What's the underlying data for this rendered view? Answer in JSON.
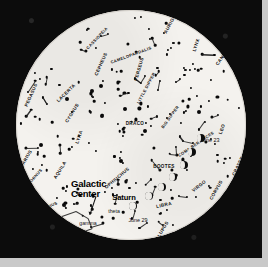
{
  "chart_data": {
    "type": "scatter",
    "subtitle": "Circular whole-sky map centered on the zenith",
    "xlabel": "",
    "ylabel": "",
    "grid": false,
    "legend_position": "none",
    "projection": "all-sky circular (polar)",
    "constellations": [
      {
        "name": "CASSIOPEIA",
        "x": 97,
        "y": 38,
        "rot": -46
      },
      {
        "name": "CAMELOPARDALIS",
        "x": 131,
        "y": 55,
        "rot": -20
      },
      {
        "name": "CEPHEUS",
        "x": 101,
        "y": 64,
        "rot": -66
      },
      {
        "name": "PERSEUS",
        "x": 139,
        "y": 69,
        "rot": -74
      },
      {
        "name": "AURIGA",
        "x": 170,
        "y": 24,
        "rot": -62
      },
      {
        "name": "LYNX",
        "x": 196,
        "y": 45,
        "rot": -72
      },
      {
        "name": "CANCER",
        "x": 223,
        "y": 56,
        "rot": -55
      },
      {
        "name": "PEGASUS",
        "x": 31,
        "y": 95,
        "rot": -66
      },
      {
        "name": "LACERTA",
        "x": 66,
        "y": 93,
        "rot": -44
      },
      {
        "name": "CYGNUS",
        "x": 72,
        "y": 113,
        "rot": -58
      },
      {
        "name": "LITTLE DIPPER",
        "x": 146,
        "y": 88,
        "rot": -62
      },
      {
        "name": "DRACO",
        "x": 135,
        "y": 123,
        "rot": 0
      },
      {
        "name": "BIG DIPPER",
        "x": 170,
        "y": 117,
        "rot": -54
      },
      {
        "name": "LYRA",
        "x": 79,
        "y": 137,
        "rot": -72
      },
      {
        "name": "COMA BERENICES",
        "x": 196,
        "y": 144,
        "rot": -34
      },
      {
        "name": "LEO",
        "x": 222,
        "y": 129,
        "rot": -70
      },
      {
        "name": "AQUILA",
        "x": 60,
        "y": 170,
        "rot": -58
      },
      {
        "name": "AQUARIUS",
        "x": 24,
        "y": 162,
        "rot": -60
      },
      {
        "name": "CAPRICORNUS",
        "x": 30,
        "y": 182,
        "rot": -48
      },
      {
        "name": "SAGITTARIUS",
        "x": 43,
        "y": 209,
        "rot": -24
      },
      {
        "name": "OPHIUCHUS",
        "x": 117,
        "y": 178,
        "rot": -40
      },
      {
        "name": "BOOTES",
        "x": 164,
        "y": 166,
        "rot": 0
      },
      {
        "name": "VIRGO",
        "x": 199,
        "y": 186,
        "rot": -38
      },
      {
        "name": "CORVUS",
        "x": 216,
        "y": 190,
        "rot": -60
      },
      {
        "name": "CRATER",
        "x": 238,
        "y": 166,
        "rot": -64
      },
      {
        "name": "LIBRA",
        "x": 164,
        "y": 205,
        "rot": -12
      },
      {
        "name": "LUPUS",
        "x": 163,
        "y": 229,
        "rot": -60
      },
      {
        "name": "SCORPIUS",
        "x": 123,
        "y": 248,
        "rot": -8
      },
      {
        "name": "HYDRA",
        "x": 213,
        "y": 223,
        "rot": -40
      }
    ],
    "annotations": [
      {
        "label": "Galactic Center",
        "x": 71,
        "y": 188,
        "style": "big"
      },
      {
        "label": "Saturn",
        "x": 124,
        "y": 197,
        "style": "mid"
      },
      {
        "label": "TEAPOT",
        "x": 63,
        "y": 229,
        "style": "mid"
      },
      {
        "label": "theta",
        "x": 114,
        "y": 211,
        "style": "small"
      },
      {
        "label": "gamma",
        "x": 88,
        "y": 223,
        "style": "small"
      },
      {
        "label": "June 23",
        "x": 210,
        "y": 140,
        "style": "date"
      },
      {
        "label": "June 29",
        "x": 138,
        "y": 220,
        "style": "date"
      }
    ],
    "moon_phases": [
      {
        "date": "June 23",
        "x": 201,
        "y": 138,
        "illum": 0.55
      },
      {
        "date": "",
        "x": 192,
        "y": 152,
        "illum": 0.45
      },
      {
        "date": "",
        "x": 184,
        "y": 165,
        "illum": 0.38
      },
      {
        "date": "",
        "x": 173,
        "y": 177,
        "illum": 0.3
      },
      {
        "date": "",
        "x": 162,
        "y": 187,
        "illum": 0.22
      },
      {
        "date": "",
        "x": 149,
        "y": 196,
        "illum": 0.15
      },
      {
        "date": "June 29",
        "x": 133,
        "y": 206,
        "illum": 0.1
      }
    ],
    "objects": [
      {
        "name": "Saturn",
        "type": "planet"
      },
      {
        "name": "Galactic Center",
        "type": "deep-sky-marker"
      },
      {
        "name": "Teapot asterism",
        "type": "asterism"
      },
      {
        "name": "Big Dipper",
        "type": "asterism"
      },
      {
        "name": "Little Dipper",
        "type": "asterism"
      }
    ],
    "colors": {
      "sky": "#f4f2ee",
      "frame": "#0c0c0c",
      "star": "#0a0a0a",
      "label": "#111111",
      "page_border": "#c9c9c9"
    },
    "star_count": 232
  }
}
